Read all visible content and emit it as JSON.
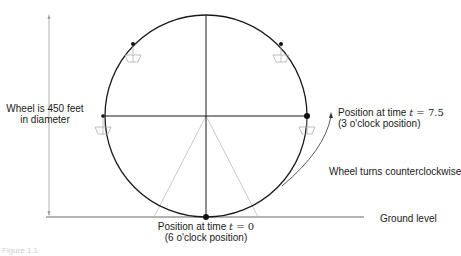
{
  "diagram": {
    "colors": {
      "wheel": "#1a1a1a",
      "support": "#b8b8b8",
      "gondola": "#b0b0b0",
      "dimension": "#9a9a9a",
      "ground": "#555555"
    },
    "labels": {
      "diameter_line1": "Wheel is 450 feet",
      "diameter_line2": "in diameter",
      "top_right_line1_prefix": "Position at time ",
      "top_right_var": "t",
      "top_right_eq": " = 7.5",
      "top_right_line2": "(3 o'clock position)",
      "rotation": "Wheel turns counterclockwise",
      "ground": "Ground level",
      "bottom_line1_prefix": "Position at time ",
      "bottom_var": "t",
      "bottom_eq": " = 0",
      "bottom_line2": "(6 o'clock position)",
      "caption": "Figure 1.1"
    },
    "geometry": {
      "center": [
        206,
        116
      ],
      "radius": 101,
      "points": [
        {
          "name": "6 o'clock",
          "x": 206,
          "y": 217
        },
        {
          "name": "3 o'clock",
          "x": 307,
          "y": 116
        },
        {
          "name": "9 o'clock",
          "x": 103,
          "y": 116
        },
        {
          "name": "upper-left",
          "x": 133,
          "y": 44
        },
        {
          "name": "upper-right",
          "x": 281,
          "y": 44
        }
      ]
    }
  }
}
